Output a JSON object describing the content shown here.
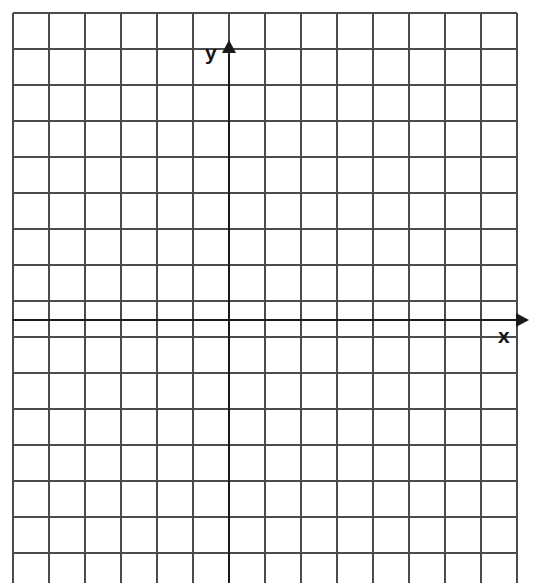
{
  "figure": {
    "kind": "blank-coordinate-grid",
    "background_color": "#ffffff",
    "grid_line_color": "#4a4a4a",
    "axis_line_color": "#1a1a1a",
    "label_color": "#161616"
  },
  "axes": {
    "x_label": "x",
    "y_label": "y",
    "x_arrow_icon": "arrow-right-icon",
    "y_arrow_icon": "arrow-up-icon"
  },
  "chart_data": {
    "type": "scatter",
    "title": "",
    "xlabel": "x",
    "ylabel": "y",
    "series": [],
    "x": [],
    "values": [],
    "annotations": [],
    "legend": [],
    "legend_position": "none",
    "grid": true,
    "grid_columns": 14,
    "grid_rows": 16,
    "cell_size_px": 36,
    "grid_origin_px": {
      "x": 13,
      "y": 13
    },
    "axis_origin_px": {
      "x": 229,
      "y": 320
    },
    "xlim": [
      -6,
      8
    ],
    "ylim": [
      -8,
      8
    ],
    "xticks": [
      -6,
      -5,
      -4,
      -3,
      -2,
      -1,
      0,
      1,
      2,
      3,
      4,
      5,
      6,
      7,
      8
    ],
    "yticks": [
      -8,
      -7,
      -6,
      -5,
      -4,
      -3,
      -2,
      -1,
      0,
      1,
      2,
      3,
      4,
      5,
      6,
      7,
      8
    ],
    "xtick_labels": [],
    "ytick_labels": []
  }
}
